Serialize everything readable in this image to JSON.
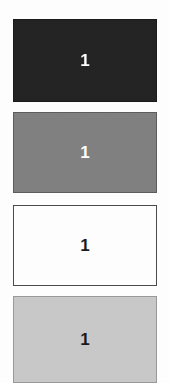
{
  "page": {
    "background_color": "#ffffff",
    "width": 169,
    "height": 383
  },
  "swatches": [
    {
      "label": "1",
      "fill_color": "#222222",
      "border_color": "#1a1a1a",
      "text_color": "#ffffff",
      "tone_name": "near-black"
    },
    {
      "label": "1",
      "fill_color": "#808080",
      "border_color": "#5c5c5c",
      "text_color": "#ffffff",
      "tone_name": "medium-gray"
    },
    {
      "label": "1",
      "fill_color": "#ffffff",
      "border_color": "#4a4a4a",
      "text_color": "#1a1a1a",
      "tone_name": "white"
    },
    {
      "label": "1",
      "fill_color": "#c9c9c9",
      "border_color": "#9a9a9a",
      "text_color": "#1a1a1a",
      "tone_name": "light-gray"
    }
  ]
}
